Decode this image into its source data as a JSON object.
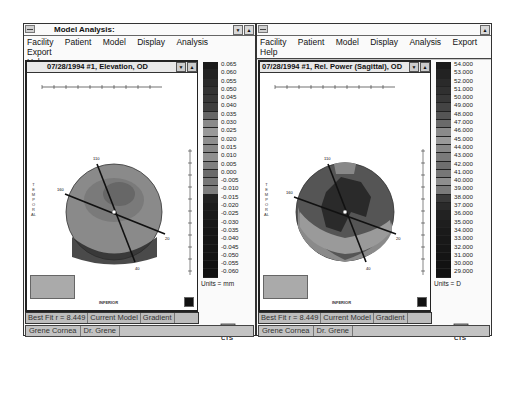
{
  "left_window": {
    "title": "Model Analysis:",
    "menu": [
      "Facility",
      "Patient",
      "Model",
      "Display",
      "Analysis",
      "Export",
      "Help"
    ],
    "map_title": "07/28/1994 #1, Elevation, OD",
    "scale_labels": [
      "0.065",
      "0.060",
      "0.055",
      "0.050",
      "0.045",
      "0.040",
      "0.035",
      "0.030",
      "0.025",
      "0.020",
      "0.015",
      "0.010",
      "0.005",
      "0.000",
      "-0.005",
      "-0.010",
      "-0.015",
      "-0.020",
      "-0.025",
      "-0.030",
      "-0.035",
      "-0.040",
      "-0.045",
      "-0.050",
      "-0.055",
      "-0.060"
    ],
    "scale_colors": [
      "#1a1a1a",
      "#222",
      "#2a2a2a",
      "#333",
      "#383838",
      "#3e3e3e",
      "#666",
      "#8a8a8a",
      "#999",
      "#8e8e8e",
      "#888",
      "#909090",
      "#808080",
      "#6a6a6a",
      "#777",
      "#7e7e7e",
      "#222",
      "#1c1c1c",
      "#1a1a1a",
      "#181818",
      "#161616",
      "#151515",
      "#141414",
      "#131313",
      "#121212",
      "#111"
    ],
    "units": "Units = mm",
    "axis_labels": {
      "top": "110",
      "left": "160",
      "right": "20",
      "bottom": "40"
    },
    "side_label": "TEMPORAL",
    "bottom_label": "INFERIOR",
    "status": [
      "Best Fit r = 8.449",
      "Current Model",
      "Gradient"
    ],
    "taskbar": [
      "Grene Cornea",
      "Dr. Grene"
    ],
    "logo_text": "CTS"
  },
  "right_window": {
    "title": "",
    "menu": [
      "Facility",
      "Patient",
      "Model",
      "Display",
      "Analysis",
      "Export",
      "Help"
    ],
    "map_title": "07/28/1994 #1, Rel. Power (Sagittal), OD",
    "scale_labels": [
      "54.000",
      "53.000",
      "52.000",
      "51.000",
      "50.000",
      "49.000",
      "48.000",
      "47.000",
      "46.000",
      "45.000",
      "44.000",
      "43.000",
      "42.000",
      "41.000",
      "40.000",
      "39.000",
      "38.000",
      "37.000",
      "36.000",
      "35.000",
      "34.000",
      "33.000",
      "32.000",
      "31.000",
      "30.000",
      "29.000"
    ],
    "scale_colors": [
      "#1a1a1a",
      "#222",
      "#2a2a2a",
      "#303030",
      "#383838",
      "#444",
      "#555",
      "#6a6a6a",
      "#8a8a8a",
      "#999",
      "#888",
      "#7a7a7a",
      "#6e6e6e",
      "#777",
      "#8e8e8e",
      "#7a7a7a",
      "#3a3a3a",
      "#2a2a2a",
      "#222",
      "#1e1e1e",
      "#1a1a1a",
      "#181818",
      "#161616",
      "#141414",
      "#121212",
      "#111"
    ],
    "units": "Units = D",
    "axis_labels": {
      "top": "110",
      "left": "160",
      "right": "20",
      "bottom": "40"
    },
    "side_label": "TEMPORAL",
    "bottom_label": "INFERIOR",
    "status": [
      "Best Fit r = 8.449",
      "Current Model",
      "Gradient"
    ],
    "taskbar": [
      "Grene Cornea",
      "Dr. Grene"
    ],
    "logo_text": "CTS"
  }
}
